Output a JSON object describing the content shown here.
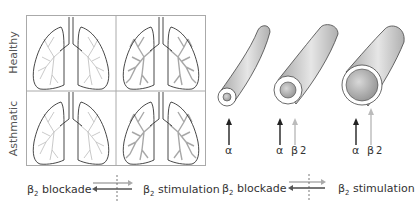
{
  "left_panel": {
    "row_labels": [
      "Healthy",
      "Asthmatic"
    ],
    "cells": [
      {
        "row": "Healthy",
        "col": "left",
        "branch_density": "light"
      },
      {
        "row": "Healthy",
        "col": "right",
        "branch_density": "heavy"
      },
      {
        "row": "Asthmatic",
        "col": "left",
        "branch_density": "light"
      },
      {
        "row": "Asthmatic",
        "col": "right",
        "branch_density": "heavy"
      }
    ],
    "caption": {
      "left": "β",
      "left_sub": "2",
      "left_text": " blockade",
      "right": "β",
      "right_sub": "2",
      "right_text": " stimulation"
    }
  },
  "right_panel": {
    "tubes": [
      {
        "size": "small",
        "labels": [
          {
            "symbol": "α",
            "color": "#222222"
          }
        ]
      },
      {
        "size": "medium",
        "labels": [
          {
            "symbol": "α",
            "color": "#222222"
          },
          {
            "symbol": "β",
            "sub": "2",
            "color": "#bbbbbb"
          }
        ]
      },
      {
        "size": "large",
        "labels": [
          {
            "symbol": "α",
            "color": "#222222"
          },
          {
            "symbol": "β",
            "sub": "2",
            "color": "#bbbbbb"
          }
        ]
      }
    ],
    "caption": {
      "left": "β",
      "left_sub": "2",
      "left_text": " blockade",
      "right": "β",
      "right_sub": "2",
      "right_text": " stimulation"
    }
  },
  "colors": {
    "outline": "#333333",
    "branch": "#b8b8b8",
    "branch_dark": "#999999",
    "grid": "#aaaaaa",
    "arrow_dark": "#222222",
    "arrow_light": "#bbbbbb"
  }
}
